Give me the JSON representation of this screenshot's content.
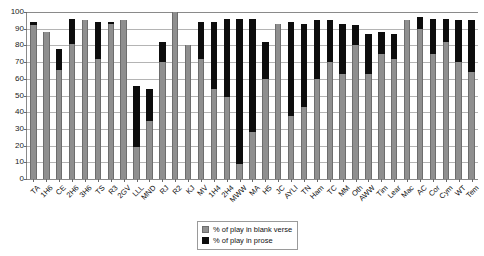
{
  "chart_data": {
    "type": "bar",
    "stacked": true,
    "title": "",
    "subtitle": "",
    "xlabel": "",
    "ylabel": "",
    "ylim": [
      0,
      100
    ],
    "ytick_step": 10,
    "yticks": [
      0,
      10,
      20,
      30,
      40,
      50,
      60,
      70,
      80,
      90,
      100
    ],
    "grid": "horizontal",
    "legend_position": "bottom-center",
    "categories": [
      "TA",
      "1H6",
      "CE",
      "2H6",
      "3H6",
      "TS",
      "R3",
      "2GV",
      "LLL",
      "MND",
      "RJ",
      "R2",
      "KJ",
      "MV",
      "1H4",
      "2H4",
      "MWW",
      "MA",
      "H5",
      "JC",
      "AYLI",
      "TN",
      "Ham",
      "TC",
      "MM",
      "Oth",
      "AWW",
      "Tim",
      "Lear",
      "Mac",
      "AC",
      "Cor",
      "Cym",
      "WT",
      "Tem"
    ],
    "series": [
      {
        "name": "% of play in blank verse",
        "color": "#8f8f8f",
        "values": [
          92,
          88,
          65,
          81,
          95,
          72,
          93,
          95,
          19,
          35,
          70,
          100,
          80,
          72,
          54,
          49,
          9,
          28,
          60,
          93,
          38,
          43,
          60,
          70,
          63,
          80,
          63,
          75,
          72,
          95,
          90,
          75,
          82,
          70,
          64
        ]
      },
      {
        "name": "% of play in prose",
        "color": "#0d0d0d",
        "values": [
          2,
          0,
          13,
          15,
          0,
          22,
          1,
          0,
          37,
          19,
          12,
          0,
          0,
          22,
          40,
          47,
          87,
          68,
          22,
          0,
          56,
          50,
          35,
          25,
          30,
          12,
          24,
          13,
          15,
          0,
          7,
          21,
          14,
          25,
          31
        ]
      }
    ],
    "series_totals": [
      94,
      88,
      78,
      96,
      95,
      94,
      94,
      95,
      56,
      54,
      82,
      100,
      80,
      94,
      94,
      96,
      96,
      96,
      82,
      93,
      94,
      93,
      95,
      95,
      93,
      92,
      87,
      88,
      87,
      95,
      97,
      96,
      96,
      95,
      95
    ]
  },
  "legend": {
    "items": [
      {
        "label": "% of play in blank verse",
        "swatch": "gray-swatch"
      },
      {
        "label": "% of play in prose",
        "swatch": "black-swatch"
      }
    ]
  },
  "colors": {
    "blank_verse": "#8f8f8f",
    "prose": "#0d0d0d",
    "gridline": "#b4b4b4",
    "axis": "#8a8a8a",
    "background": "#ffffff"
  }
}
